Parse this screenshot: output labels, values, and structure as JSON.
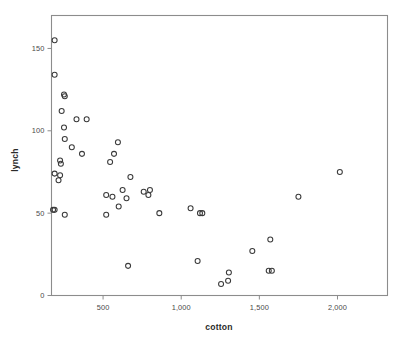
{
  "chart_data": {
    "type": "scatter",
    "title": "",
    "xlabel": "cotton",
    "ylabel": "lynch",
    "xlim": [
      170,
      2320
    ],
    "ylim": [
      0,
      170
    ],
    "grid": false,
    "legend": null,
    "x_ticks": [
      500,
      1000,
      1500,
      2000
    ],
    "x_tick_labels": [
      "500",
      "1,000",
      "1,500",
      "2,000"
    ],
    "y_ticks": [
      0,
      50,
      100,
      150
    ],
    "y_tick_labels": [
      "0",
      "50",
      "100",
      "150"
    ],
    "marker": "open-circle",
    "marker_color": "#3a3a3a",
    "points": [
      {
        "x": 190,
        "y": 155
      },
      {
        "x": 190,
        "y": 134
      },
      {
        "x": 250,
        "y": 122
      },
      {
        "x": 255,
        "y": 121
      },
      {
        "x": 235,
        "y": 112
      },
      {
        "x": 330,
        "y": 107
      },
      {
        "x": 395,
        "y": 107
      },
      {
        "x": 250,
        "y": 102
      },
      {
        "x": 255,
        "y": 95
      },
      {
        "x": 300,
        "y": 90
      },
      {
        "x": 595,
        "y": 93
      },
      {
        "x": 365,
        "y": 86
      },
      {
        "x": 570,
        "y": 86
      },
      {
        "x": 225,
        "y": 82
      },
      {
        "x": 230,
        "y": 80
      },
      {
        "x": 545,
        "y": 81
      },
      {
        "x": 190,
        "y": 74
      },
      {
        "x": 225,
        "y": 73
      },
      {
        "x": 215,
        "y": 70
      },
      {
        "x": 675,
        "y": 72
      },
      {
        "x": 625,
        "y": 64
      },
      {
        "x": 800,
        "y": 64
      },
      {
        "x": 520,
        "y": 61
      },
      {
        "x": 760,
        "y": 63
      },
      {
        "x": 790,
        "y": 61
      },
      {
        "x": 560,
        "y": 60
      },
      {
        "x": 650,
        "y": 59
      },
      {
        "x": 1750,
        "y": 60
      },
      {
        "x": 600,
        "y": 54
      },
      {
        "x": 180,
        "y": 52
      },
      {
        "x": 190,
        "y": 52
      },
      {
        "x": 1060,
        "y": 53
      },
      {
        "x": 1120,
        "y": 50
      },
      {
        "x": 1135,
        "y": 50
      },
      {
        "x": 860,
        "y": 50
      },
      {
        "x": 255,
        "y": 49
      },
      {
        "x": 520,
        "y": 49
      },
      {
        "x": 2015,
        "y": 75
      },
      {
        "x": 1570,
        "y": 34
      },
      {
        "x": 1455,
        "y": 27
      },
      {
        "x": 1105,
        "y": 21
      },
      {
        "x": 660,
        "y": 18
      },
      {
        "x": 1305,
        "y": 14
      },
      {
        "x": 1560,
        "y": 15
      },
      {
        "x": 1580,
        "y": 15
      },
      {
        "x": 1300,
        "y": 9
      },
      {
        "x": 1255,
        "y": 7
      }
    ]
  }
}
